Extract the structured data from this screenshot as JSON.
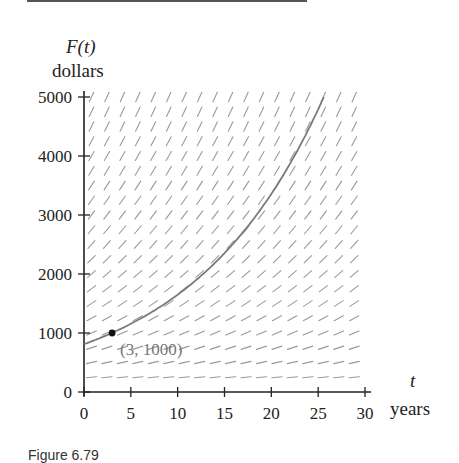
{
  "figure": {
    "y_axis_label": "F(t)",
    "y_axis_unit": "dollars",
    "x_axis_label": "t",
    "x_axis_unit": "years",
    "caption": "Figure 6.79"
  },
  "chart_data": {
    "type": "line",
    "title": "",
    "xlabel": "t (years)",
    "ylabel": "F(t) (dollars)",
    "xlim": [
      0,
      30
    ],
    "ylim": [
      0,
      5000
    ],
    "x_ticks": [
      0,
      5,
      10,
      15,
      20,
      25,
      30
    ],
    "y_ticks": [
      0,
      1000,
      2000,
      3000,
      4000,
      5000
    ],
    "grid": false,
    "legend": null,
    "slope_field": {
      "description": "Slope field for dF/dt proportional to F",
      "rate": 0.07
    },
    "series": [
      {
        "name": "Solution curve through (3, 1000)",
        "x": [
          0,
          3,
          5,
          10,
          15,
          20,
          25,
          25.6
        ],
        "values": [
          810,
          1000,
          1150,
          1630,
          2320,
          3300,
          4700,
          5000
        ]
      }
    ],
    "annotations": [
      {
        "x": 3,
        "y": 1000,
        "text": "(3, 1000)"
      }
    ]
  }
}
